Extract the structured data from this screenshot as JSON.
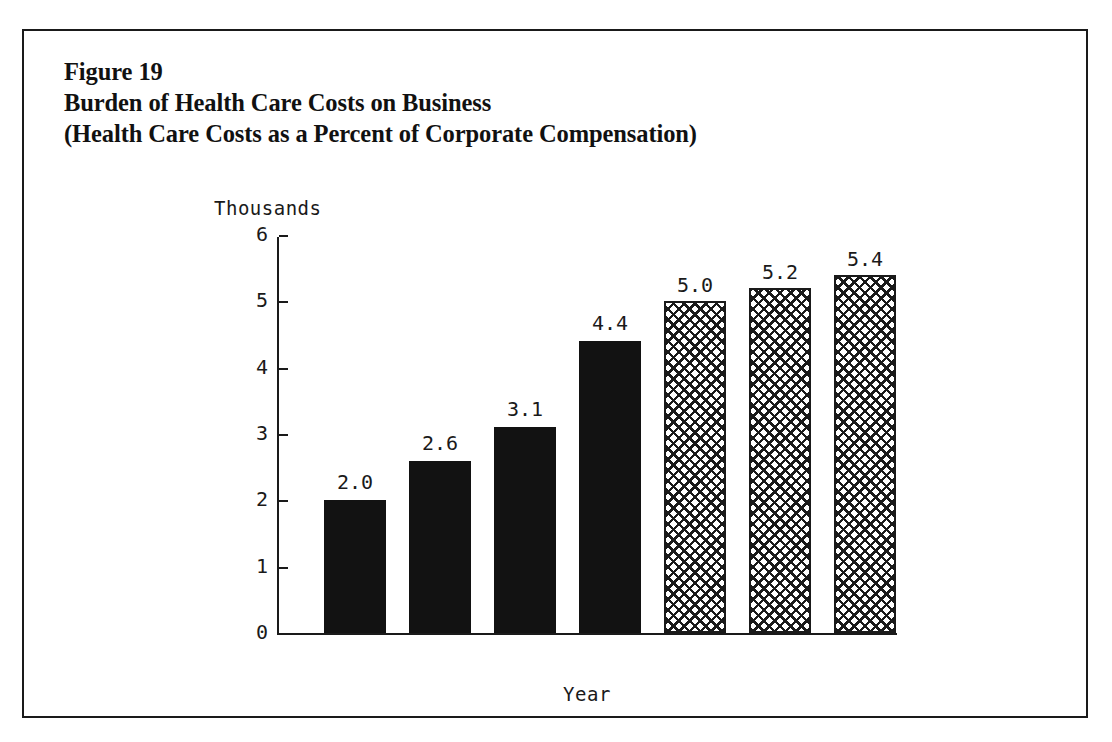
{
  "figure": {
    "caption_lines": [
      "Figure 19",
      "Burden of Health Care Costs on Business",
      "(Health Care Costs as a Percent of Corporate Compensation)"
    ]
  },
  "chart_data": {
    "type": "bar",
    "title": "Burden of Health Care Costs on Business",
    "subtitle": "(Health Care Costs as a Percent of Corporate Compensation)",
    "figure_number": "Figure 19",
    "unit_label": "Thousands",
    "xlabel": "Year",
    "ylabel": "",
    "ylim": [
      0,
      6
    ],
    "yticks": [
      "0",
      "1",
      "2",
      "3",
      "4",
      "5",
      "6"
    ],
    "grid": false,
    "legend": "none",
    "categories": [
      "1970",
      "1975",
      "1980",
      "1985",
      "1990",
      "1995",
      "2000"
    ],
    "values": [
      2.0,
      2.6,
      3.1,
      4.4,
      5.0,
      5.2,
      5.4
    ],
    "value_labels": [
      "2.0",
      "2.6",
      "3.1",
      "4.4",
      "5.0",
      "5.2",
      "5.4"
    ],
    "bar_styles": [
      "solid",
      "solid",
      "solid",
      "solid",
      "hatch",
      "hatch",
      "hatch"
    ],
    "colors": {
      "solid_bar": "#121212",
      "hatch_line": "#1a1a1a",
      "hatch_background": "#ffffff",
      "axis": "#1a1a1a",
      "text": "#111111",
      "page_background": "#ffffff"
    }
  }
}
